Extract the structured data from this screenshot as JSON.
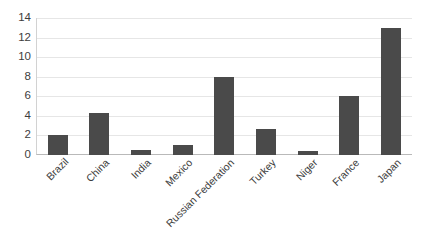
{
  "chart_data": {
    "type": "bar",
    "title": "",
    "subtitle": "",
    "xlabel": "",
    "ylabel": "",
    "categories": [
      "Brazil",
      "China",
      "India",
      "Mexico",
      "Russian Federation",
      "Turkey",
      "Niger",
      "France",
      "Japan"
    ],
    "values": [
      2.0,
      4.3,
      0.5,
      1.0,
      8.0,
      2.7,
      0.4,
      6.0,
      13.0
    ],
    "ylim": [
      0,
      14
    ],
    "ytick_labels": [
      "14",
      "12",
      "10",
      "8",
      "6",
      "4",
      "2",
      "0"
    ],
    "ytick_values": [
      14,
      12,
      10,
      8,
      6,
      4,
      2,
      0
    ],
    "grid": "horizontal",
    "legend": "none",
    "bar_color": "#4a4a4a",
    "gridline_color": "#e6e6e6",
    "axis_color": "#b9b9b9",
    "text_color": "#3d3d3d",
    "background_color": "#ffffff",
    "xtick_label_rotation_deg": -45,
    "annotations": []
  }
}
